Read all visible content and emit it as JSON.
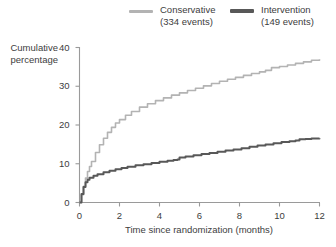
{
  "chart_data": {
    "type": "line",
    "title": "",
    "subtitle": "",
    "xlabel": "Time since randomization (months)",
    "ylabel": "Cumulative percentage",
    "ylabel_lines": [
      "Cumulative",
      "percentage"
    ],
    "xlim": [
      0,
      12
    ],
    "ylim": [
      0,
      40
    ],
    "xticks": [
      0,
      2,
      4,
      6,
      8,
      10,
      12
    ],
    "yticks": [
      0,
      10,
      20,
      30,
      40
    ],
    "xtick_labels": [
      "0",
      "2",
      "4",
      "6",
      "8",
      "10",
      "12"
    ],
    "ytick_labels": [
      "0",
      "10",
      "20",
      "30",
      "40"
    ],
    "grid": false,
    "legend_position": "top",
    "colors": {
      "conservative": "#b3b3b3",
      "intervention": "#585858",
      "axis": "#9a9a9a",
      "text": "#3d3d3d",
      "background": "#ffffff"
    },
    "series": [
      {
        "name": "Conservative",
        "events": 334,
        "legend_label": "Conservative",
        "legend_sublabel": "(334 events)",
        "color": "#b3b3b3",
        "linewidth": 1.6,
        "x": [
          0,
          0.1,
          0.2,
          0.3,
          0.4,
          0.5,
          0.6,
          0.8,
          1.0,
          1.2,
          1.4,
          1.6,
          1.8,
          2.0,
          2.3,
          2.6,
          3.0,
          3.4,
          3.8,
          4.2,
          4.6,
          5.0,
          5.4,
          5.8,
          6.2,
          6.6,
          7.0,
          7.4,
          7.8,
          8.2,
          8.6,
          9.0,
          9.3,
          9.6,
          10.0,
          10.4,
          10.8,
          11.2,
          11.6,
          12.0
        ],
        "y": [
          0,
          2.0,
          4.2,
          6.3,
          8.0,
          9.3,
          10.6,
          12.9,
          14.9,
          16.6,
          18.1,
          19.4,
          20.5,
          21.4,
          22.5,
          23.5,
          24.6,
          25.5,
          26.3,
          27.0,
          27.7,
          28.3,
          28.9,
          29.5,
          30.1,
          30.7,
          31.3,
          31.8,
          32.3,
          32.8,
          33.3,
          33.7,
          34.1,
          34.8,
          35.1,
          35.5,
          35.9,
          36.3,
          36.7,
          37.0
        ]
      },
      {
        "name": "Intervention",
        "events": 149,
        "legend_label": "Intervention",
        "legend_sublabel": "(149 events)",
        "color": "#585858",
        "linewidth": 2.0,
        "x": [
          0,
          0.1,
          0.2,
          0.3,
          0.4,
          0.5,
          0.7,
          0.9,
          1.2,
          1.5,
          1.8,
          2.1,
          2.4,
          2.8,
          3.2,
          3.6,
          4.0,
          4.4,
          4.7,
          4.9,
          5.0,
          5.3,
          5.7,
          6.1,
          6.5,
          6.9,
          7.3,
          7.7,
          8.1,
          8.5,
          8.9,
          9.3,
          9.7,
          10.1,
          10.5,
          10.8,
          11.0,
          11.3,
          11.6,
          12.0
        ],
        "y": [
          0,
          2.2,
          4.0,
          5.2,
          5.9,
          6.4,
          6.9,
          7.3,
          7.8,
          8.2,
          8.6,
          8.9,
          9.2,
          9.6,
          9.9,
          10.2,
          10.5,
          10.8,
          11.0,
          11.1,
          11.6,
          11.9,
          12.2,
          12.5,
          12.8,
          13.1,
          13.4,
          13.7,
          14.0,
          14.4,
          14.7,
          15.0,
          15.3,
          15.6,
          15.8,
          16.0,
          16.3,
          16.4,
          16.5,
          16.6
        ]
      }
    ]
  },
  "legend": {
    "conservative": {
      "label": "Conservative",
      "sublabel": "(334 events)"
    },
    "intervention": {
      "label": "Intervention",
      "sublabel": "(149 events)"
    }
  },
  "axes": {
    "ylabel_line1": "Cumulative",
    "ylabel_line2": "percentage",
    "xlabel": "Time since randomization (months)"
  }
}
